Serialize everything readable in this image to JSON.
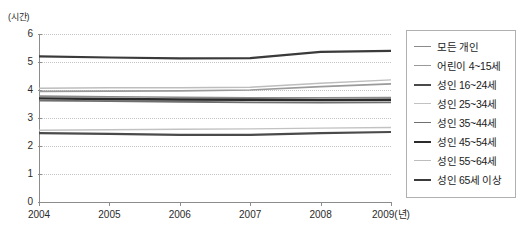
{
  "axes": {
    "y_unit_label": "(시간)",
    "y_ticks": [
      "6",
      "5",
      "4",
      "3",
      "2",
      "1",
      "0"
    ],
    "x_ticks": [
      "2004",
      "2005",
      "2006",
      "2007",
      "2008",
      "2009(년)"
    ]
  },
  "legend": {
    "items": [
      {
        "label": "모든 개인",
        "color": "#8a8a8a",
        "width": "1.6"
      },
      {
        "label": "어린이 4~15세",
        "color": "#9a9a9a",
        "width": "1.6"
      },
      {
        "label": "성인 16~24세",
        "color": "#4a4a4a",
        "width": "2.2"
      },
      {
        "label": "성인 25~34세",
        "color": "#c2c2c2",
        "width": "1.4"
      },
      {
        "label": "성인 35~44세",
        "color": "#6f6f6f",
        "width": "1.8"
      },
      {
        "label": "성인 45~54세",
        "color": "#2b2b2b",
        "width": "2.4"
      },
      {
        "label": "성인 55~64세",
        "color": "#bdbdbd",
        "width": "1.4"
      },
      {
        "label": "성인 65세 이상",
        "color": "#3a3a3a",
        "width": "2.2"
      }
    ]
  },
  "chart_data": {
    "type": "line",
    "title": "",
    "xlabel": "(년)",
    "ylabel": "(시간)",
    "x": [
      2004,
      2005,
      2006,
      2007,
      2008,
      2009
    ],
    "xlim": [
      2004,
      2009
    ],
    "ylim": [
      0,
      6
    ],
    "ytick_step": 1,
    "grid": true,
    "legend_position": "right",
    "series": [
      {
        "name": "모든 개인",
        "color": "#8a8a8a",
        "width": 1.6,
        "values": [
          3.78,
          3.76,
          3.74,
          3.72,
          3.72,
          3.73
        ]
      },
      {
        "name": "어린이 4~15세",
        "color": "#9a9a9a",
        "width": 1.6,
        "values": [
          3.95,
          3.96,
          3.97,
          4.0,
          4.12,
          4.22
        ]
      },
      {
        "name": "성인 16~24세",
        "color": "#4a4a4a",
        "width": 2.2,
        "values": [
          2.46,
          2.43,
          2.4,
          2.4,
          2.46,
          2.5
        ]
      },
      {
        "name": "성인 25~34세",
        "color": "#c2c2c2",
        "width": 1.4,
        "values": [
          2.56,
          2.58,
          2.6,
          2.61,
          2.64,
          2.66
        ]
      },
      {
        "name": "성인 35~44세",
        "color": "#6f6f6f",
        "width": 1.8,
        "values": [
          3.62,
          3.6,
          3.58,
          3.56,
          3.55,
          3.56
        ]
      },
      {
        "name": "성인 45~54세",
        "color": "#2b2b2b",
        "width": 2.4,
        "values": [
          3.7,
          3.68,
          3.66,
          3.65,
          3.64,
          3.65
        ]
      },
      {
        "name": "성인 55~64세",
        "color": "#bdbdbd",
        "width": 1.4,
        "values": [
          4.06,
          4.08,
          4.08,
          4.1,
          4.24,
          4.36
        ]
      },
      {
        "name": "성인 65세 이상",
        "color": "#3a3a3a",
        "width": 2.2,
        "values": [
          5.2,
          5.16,
          5.13,
          5.14,
          5.36,
          5.4
        ]
      }
    ]
  }
}
